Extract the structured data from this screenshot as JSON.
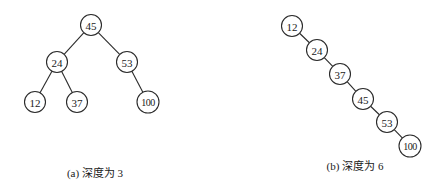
{
  "diagrams": [
    {
      "id": "a",
      "caption": "(a)  深度为 3",
      "caption_pos": [
        95,
        164
      ],
      "nodes": [
        {
          "label": "45",
          "x": 91,
          "y": 25
        },
        {
          "label": "24",
          "x": 57,
          "y": 62
        },
        {
          "label": "53",
          "x": 127,
          "y": 62
        },
        {
          "label": "12",
          "x": 35,
          "y": 102
        },
        {
          "label": "37",
          "x": 77,
          "y": 102
        },
        {
          "label": "100",
          "x": 148,
          "y": 102
        }
      ],
      "edges": [
        [
          0,
          1
        ],
        [
          0,
          2
        ],
        [
          1,
          3
        ],
        [
          1,
          4
        ],
        [
          2,
          5
        ]
      ]
    },
    {
      "id": "b",
      "caption": "(b)  深度为 6",
      "caption_pos": [
        355,
        157
      ],
      "nodes": [
        {
          "label": "12",
          "x": 292,
          "y": 26
        },
        {
          "label": "24",
          "x": 317,
          "y": 50
        },
        {
          "label": "37",
          "x": 340,
          "y": 74
        },
        {
          "label": "45",
          "x": 363,
          "y": 99
        },
        {
          "label": "53",
          "x": 387,
          "y": 122
        },
        {
          "label": "100",
          "x": 410,
          "y": 146
        }
      ],
      "edges": [
        [
          0,
          1
        ],
        [
          1,
          2
        ],
        [
          2,
          3
        ],
        [
          3,
          4
        ],
        [
          4,
          5
        ]
      ]
    }
  ],
  "node_radius": 10.5
}
